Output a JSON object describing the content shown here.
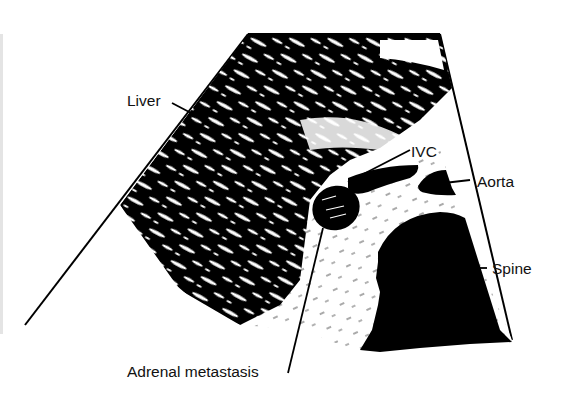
{
  "figure": {
    "type": "ultrasound schematic drawing",
    "colors": {
      "background": "#ffffff",
      "ink": "#000000"
    },
    "labels": {
      "liver": "Liver",
      "ivc": "IVC",
      "aorta": "Aorta",
      "spine": "Spine",
      "adrenal": "Adrenal metastasis"
    },
    "structures": [
      "liver",
      "ivc",
      "aorta",
      "spine",
      "adrenal-metastasis",
      "ultrasound-sector-outline"
    ]
  }
}
